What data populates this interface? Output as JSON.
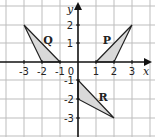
{
  "diagram": {
    "type": "coordinate-grid",
    "x_axis": {
      "label": "x",
      "ticks": [
        "-3",
        "-2",
        "-1",
        "0",
        "1",
        "2",
        "3"
      ],
      "range": [
        -4,
        4
      ]
    },
    "y_axis": {
      "label": "y",
      "ticks": [
        "2",
        "1",
        "-1",
        "-2",
        "-3"
      ],
      "range": [
        -4,
        3
      ]
    },
    "origin_label": "0",
    "colors": {
      "grid": "#bdbdbd",
      "axis": "#111111",
      "fill": "#d9d9d9",
      "stroke": "#222222"
    },
    "shapes": [
      {
        "name": "Q",
        "vertices": [
          [
            -3,
            2
          ],
          [
            -2,
            0
          ],
          [
            -1,
            0
          ]
        ]
      },
      {
        "name": "P",
        "vertices": [
          [
            3,
            2
          ],
          [
            1,
            0
          ],
          [
            2,
            0
          ]
        ]
      },
      {
        "name": "R",
        "vertices": [
          [
            0,
            -1
          ],
          [
            0,
            -2
          ],
          [
            2,
            -3
          ]
        ]
      }
    ]
  }
}
